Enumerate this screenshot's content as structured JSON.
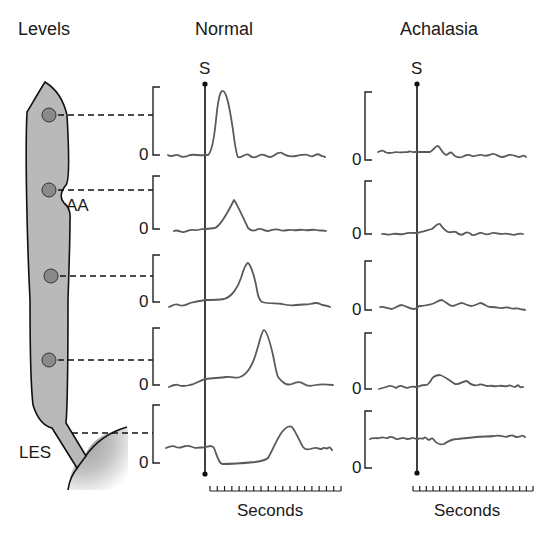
{
  "titles": {
    "levels": "Levels",
    "normal": "Normal",
    "achalasia": "Achalasia"
  },
  "labels": {
    "aa": "AA",
    "les": "LES",
    "swallow_marker": "S",
    "zero": "0",
    "x_axis_normal": "Seconds",
    "x_axis_achalasia": "Seconds"
  },
  "colors": {
    "esophagus_fill": "#b9b9b9",
    "sensor_fill": "#8a8a8a",
    "trace": "#5a5a5a",
    "line": "#111111"
  },
  "diagram": {
    "sensor_levels": [
      "level-1",
      "AA",
      "level-3",
      "level-4",
      "LES"
    ],
    "panels": [
      {
        "name": "Normal",
        "traces": [
          {
            "level": 1,
            "description": "tall sharp peristaltic peak shortly after swallow",
            "peak_fraction": 0.95
          },
          {
            "level": 2,
            "description": "small triangular peak, later",
            "peak_fraction": 0.55
          },
          {
            "level": 3,
            "description": "medium peak, later",
            "peak_fraction": 0.75
          },
          {
            "level": 4,
            "description": "tall peak, later",
            "peak_fraction": 0.95
          },
          {
            "level": 5,
            "description": "LES relaxation drop below baseline, then contraction peak",
            "peak_fraction": 0.6
          }
        ]
      },
      {
        "name": "Achalasia",
        "traces": [
          {
            "level": 1,
            "description": "small low-amplitude blip",
            "peak_fraction": 0.15
          },
          {
            "level": 2,
            "description": "small low-amplitude blip",
            "peak_fraction": 0.15
          },
          {
            "level": 3,
            "description": "small low-amplitude blip",
            "peak_fraction": 0.15
          },
          {
            "level": 4,
            "description": "small low-amplitude simultaneous blip",
            "peak_fraction": 0.2
          },
          {
            "level": 5,
            "description": "elevated LES pressure without relaxation",
            "peak_fraction": 0.55
          }
        ]
      }
    ],
    "time_axis_ticks": 18
  }
}
